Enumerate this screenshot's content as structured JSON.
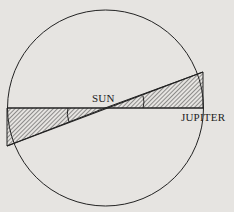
{
  "diagram": {
    "labels": {
      "sun": "SUN",
      "jupiter": "JUPITER"
    },
    "colors": {
      "background": "#e6e4e1",
      "ink": "#222222"
    }
  }
}
